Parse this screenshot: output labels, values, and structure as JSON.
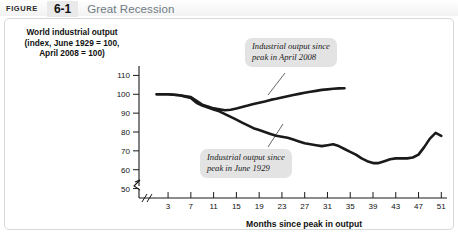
{
  "header": {
    "figure_label": "FIGURE",
    "figure_number": "6-1",
    "title": "Great Recession"
  },
  "chart_data": {
    "type": "line",
    "title": "Great Recession",
    "ylabel": "World industrial output (index, June 1929 = 100, April 2008 = 100)",
    "xlabel": "Months since peak in output",
    "xlim": [
      0,
      52
    ],
    "ylim": [
      45,
      115
    ],
    "xticks": [
      3,
      7,
      11,
      15,
      19,
      23,
      27,
      31,
      35,
      39,
      43,
      47,
      51
    ],
    "yticks": [
      50,
      60,
      70,
      80,
      90,
      100,
      110
    ],
    "y_axis_break": true,
    "grid": false,
    "legend_position": "annotations",
    "annotations": [
      {
        "name": "callout-2008",
        "text": "Industrial output since peak in April 2008",
        "line1": "Industrial output since",
        "line2": "peak in April 2008"
      },
      {
        "name": "callout-1929",
        "text": "Industrial output since peak in June 1929",
        "line1": "Industrial output since",
        "line2": "peak in June 1929"
      }
    ],
    "series": [
      {
        "name": "Industrial output since peak in April 2008",
        "x": [
          1,
          3,
          5,
          7,
          8,
          9,
          10,
          11,
          12,
          13,
          14,
          15,
          16,
          17,
          18,
          19,
          20,
          21,
          22,
          23,
          24,
          25,
          26,
          27,
          28,
          29,
          30,
          31,
          32,
          33,
          34
        ],
        "values": [
          100,
          100,
          99.5,
          98.5,
          96.5,
          94.5,
          93.5,
          92.5,
          92.0,
          91.5,
          91.8,
          92.5,
          93.3,
          94.0,
          94.8,
          95.5,
          96.2,
          97.0,
          97.6,
          98.3,
          99.0,
          99.6,
          100.2,
          100.8,
          101.3,
          101.8,
          102.3,
          102.6,
          102.9,
          103.1,
          103.2
        ]
      },
      {
        "name": "Industrial output since peak in June 1929",
        "x": [
          1,
          3,
          5,
          7,
          8,
          9,
          10,
          11,
          12,
          13,
          14,
          15,
          16,
          17,
          18,
          19,
          20,
          21,
          22,
          23,
          24,
          25,
          26,
          27,
          28,
          29,
          30,
          31,
          32,
          33,
          34,
          35,
          36,
          37,
          38,
          39,
          40,
          41,
          42,
          43,
          44,
          45,
          46,
          47,
          48,
          49,
          50,
          51
        ],
        "values": [
          100,
          100,
          99.5,
          98.0,
          95.5,
          94.0,
          93.0,
          92.0,
          91.0,
          89.5,
          88.0,
          86.5,
          85.0,
          83.5,
          82.0,
          81.0,
          80.0,
          79.0,
          78.0,
          77.5,
          77.0,
          76.0,
          75.0,
          74.0,
          73.5,
          73.0,
          72.5,
          73.0,
          73.5,
          72.5,
          71.0,
          69.5,
          68.0,
          66.0,
          64.5,
          63.5,
          63.5,
          64.5,
          65.5,
          66.0,
          66.0,
          66.0,
          66.5,
          68.0,
          72.0,
          76.5,
          79.5,
          78.0
        ]
      }
    ]
  },
  "source_note": ""
}
